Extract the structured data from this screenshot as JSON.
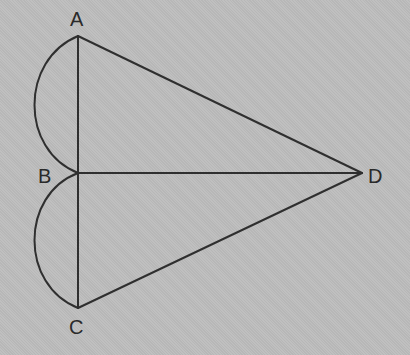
{
  "diagram": {
    "points": [
      {
        "id": "A",
        "label": "A",
        "x": 78,
        "y": 36
      },
      {
        "id": "B",
        "label": "B",
        "x": 78,
        "y": 173
      },
      {
        "id": "C",
        "label": "C",
        "x": 78,
        "y": 308
      },
      {
        "id": "D",
        "label": "D",
        "x": 362,
        "y": 173
      }
    ],
    "segments": [
      "AB",
      "BC",
      "AD",
      "BD",
      "CD"
    ],
    "arcs": [
      {
        "from": "A",
        "to": "B",
        "side": "left",
        "type": "semicircle"
      },
      {
        "from": "B",
        "to": "C",
        "side": "left",
        "type": "semicircle"
      }
    ],
    "labels": {
      "A": "A",
      "B": "B",
      "C": "C",
      "D": "D"
    },
    "colors": {
      "background": "#bdbdbd",
      "stroke": "#2f2f2f"
    }
  }
}
